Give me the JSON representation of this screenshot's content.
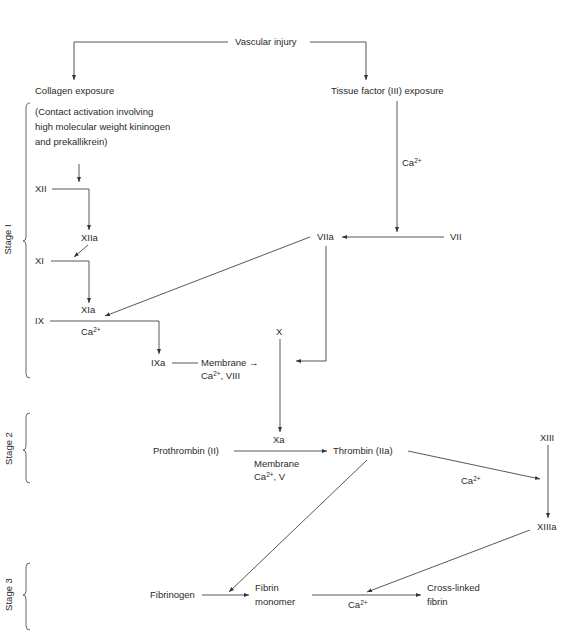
{
  "diagram": {
    "stages": [
      {
        "id": "stage1",
        "label": "Stage I"
      },
      {
        "id": "stage2",
        "label": "Stage 2"
      },
      {
        "id": "stage3",
        "label": "Stage 3"
      }
    ],
    "nodes": {
      "vascular_injury": "Vascular injury",
      "collagen_exposure": "Collagen exposure",
      "tissue_factor": "Tissue factor (III) exposure",
      "contact_activation_1": "(Contact activation involving",
      "contact_activation_2": "high molecular weight kininogen",
      "contact_activation_3": "and prekallikrein)",
      "xii": "XII",
      "xiia": "XIIa",
      "xi": "XI",
      "xia": "XIa",
      "ix": "IX",
      "ixa": "IXa",
      "vii": "VII",
      "viia": "VIIa",
      "x": "X",
      "xa": "Xa",
      "prothrombin": "Prothrombin (II)",
      "thrombin": "Thrombin (IIa)",
      "xiii": "XIII",
      "xiiia": "XIIIa",
      "fibrinogen": "Fibrinogen",
      "fibrin_monomer_1": "Fibrin",
      "fibrin_monomer_2": "monomer",
      "cross_linked_1": "Cross-linked",
      "cross_linked_2": "fibrin"
    },
    "cofactors": {
      "ca_tf": "Ca",
      "ca_ix": "Ca",
      "membrane_ixa": "Membrane →",
      "ca_viii_prefix": "Ca",
      "ca_viii_suffix": ", VIII",
      "membrane_xa": "Membrane",
      "ca_v_prefix": "Ca",
      "ca_v_suffix": ", V",
      "ca_xiii": "Ca",
      "ca_fibrin": "Ca",
      "charge": "2+"
    }
  }
}
